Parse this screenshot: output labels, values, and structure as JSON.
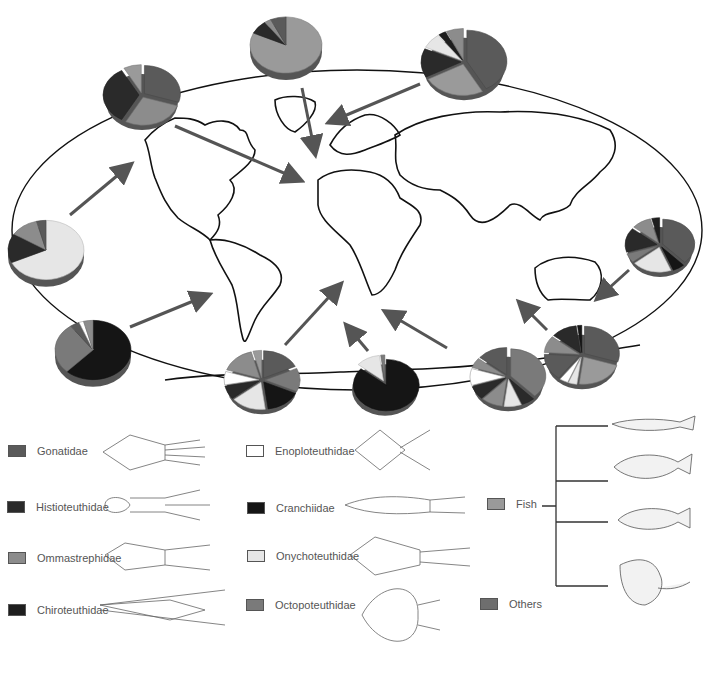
{
  "figure": {
    "type": "world map diagram of cephalopod diet composition (pie charts) with flow arrows",
    "colors": {
      "Gonatidae": "#5a5a5a",
      "Histioteuthidae": "#2a2a2a",
      "Ommastrephidae": "#8c8c8c",
      "Chiroteuthidae": "#1e1e1e",
      "Enoploteuthidae": "#ffffff",
      "Cranchiidae": "#151515",
      "Onychoteuthidae": "#e6e6e6",
      "Octopoteuthidae": "#7a7a7a",
      "Fish": "#9a9a9a",
      "Others": "#6e6e6e"
    }
  },
  "legend": {
    "squid_families": [
      {
        "label": "Gonatidae",
        "key": "Gonatidae"
      },
      {
        "label": "Histioteuthidae",
        "key": "Histioteuthidae"
      },
      {
        "label": "Ommastrephidae",
        "key": "Ommastrephidae"
      },
      {
        "label": "Chiroteuthidae",
        "key": "Chiroteuthidae"
      },
      {
        "label": "Enoploteuthidae",
        "key": "Enoploteuthidae"
      },
      {
        "label": "Cranchiidae",
        "key": "Cranchiidae"
      },
      {
        "label": "Onychoteuthidae",
        "key": "Onychoteuthidae"
      },
      {
        "label": "Octopoteuthidae",
        "key": "Octopoteuthidae"
      }
    ],
    "other": [
      {
        "label": "Fish",
        "key": "Fish"
      },
      {
        "label": "Others",
        "key": "Others"
      }
    ]
  },
  "pies": [
    {
      "id": "north-pacific-east",
      "cx": 142,
      "cy": 95,
      "r": 36,
      "slices": [
        [
          "Gonatidae",
          0.3
        ],
        [
          "Ommastrephidae",
          0.28
        ],
        [
          "Histioteuthidae",
          0.34
        ],
        [
          "Fish",
          0.08
        ]
      ],
      "explode": true
    },
    {
      "id": "greenland",
      "cx": 286,
      "cy": 45,
      "r": 36,
      "slices": [
        [
          "Fish",
          0.82
        ],
        [
          "Histioteuthidae",
          0.08
        ],
        [
          "Ommastrephidae",
          0.03
        ],
        [
          "Gonatidae",
          0.07
        ]
      ],
      "explode": false
    },
    {
      "id": "north-pacific-west",
      "cx": 464,
      "cy": 62,
      "r": 40,
      "slices": [
        [
          "Gonatidae",
          0.42
        ],
        [
          "Fish",
          0.25
        ],
        [
          "Histioteuthidae",
          0.15
        ],
        [
          "Onychoteuthidae",
          0.08
        ],
        [
          "Chiroteuthidae",
          0.03
        ],
        [
          "Ommastrephidae",
          0.07
        ]
      ],
      "explode": true
    },
    {
      "id": "east-pacific",
      "cx": 46,
      "cy": 250,
      "r": 38,
      "slices": [
        [
          "Onychoteuthidae",
          0.68
        ],
        [
          "Histioteuthidae",
          0.16
        ],
        [
          "Ommastrephidae",
          0.12
        ],
        [
          "Gonatidae",
          0.04
        ]
      ],
      "explode": false
    },
    {
      "id": "south-east-pacific",
      "cx": 93,
      "cy": 350,
      "r": 38,
      "slices": [
        [
          "Cranchiidae",
          0.62
        ],
        [
          "Octopoteuthidae",
          0.28
        ],
        [
          "Gonatidae",
          0.04
        ],
        [
          "Enoploteuthidae",
          0.02
        ],
        [
          "Ommastrephidae",
          0.04
        ]
      ],
      "explode": false
    },
    {
      "id": "south-atlantic-west",
      "cx": 262,
      "cy": 380,
      "r": 35,
      "slices": [
        [
          "Gonatidae",
          0.18
        ],
        [
          "Octopoteuthidae",
          0.14
        ],
        [
          "Cranchiidae",
          0.16
        ],
        [
          "Onychoteuthidae",
          0.16
        ],
        [
          "Histioteuthidae",
          0.08
        ],
        [
          "Enoploteuthidae",
          0.08
        ],
        [
          "Ommastrephidae",
          0.16
        ],
        [
          "Fish",
          0.04
        ]
      ],
      "explode": true
    },
    {
      "id": "south-atlantic-east",
      "cx": 385,
      "cy": 383,
      "r": 33,
      "slices": [
        [
          "Cranchiidae",
          0.86
        ],
        [
          "Onychoteuthidae",
          0.12
        ],
        [
          "Octopoteuthidae",
          0.02
        ]
      ],
      "explode": true
    },
    {
      "id": "south-indian-west",
      "cx": 508,
      "cy": 377,
      "r": 35,
      "slices": [
        [
          "Octopoteuthidae",
          0.38
        ],
        [
          "Histioteuthidae",
          0.06
        ],
        [
          "Onychoteuthidae",
          0.08
        ],
        [
          "Ommastrephidae",
          0.1
        ],
        [
          "Histioteuthidae",
          0.08
        ],
        [
          "Enoploteuthidae",
          0.1
        ],
        [
          "Ommastrephidae",
          0.06
        ],
        [
          "Gonatidae",
          0.14
        ]
      ],
      "explode": true
    },
    {
      "id": "south-indian-east",
      "cx": 582,
      "cy": 355,
      "r": 35,
      "slices": [
        [
          "Gonatidae",
          0.3
        ],
        [
          "Fish",
          0.22
        ],
        [
          "Onychoteuthidae",
          0.04
        ],
        [
          "Enoploteuthidae",
          0.04
        ],
        [
          "Gonatidae",
          0.16
        ],
        [
          "Ommastrephidae",
          0.1
        ],
        [
          "Histioteuthidae",
          0.12
        ],
        [
          "Cranchiidae",
          0.02
        ]
      ],
      "explode": true
    },
    {
      "id": "tasman",
      "cx": 660,
      "cy": 245,
      "r": 32,
      "slices": [
        [
          "Gonatidae",
          0.38
        ],
        [
          "Cranchiidae",
          0.06
        ],
        [
          "Onychoteuthidae",
          0.2
        ],
        [
          "Octopoteuthidae",
          0.06
        ],
        [
          "Histioteuthidae",
          0.16
        ],
        [
          "Ommastrephidae",
          0.1
        ],
        [
          "Chiroteuthidae",
          0.04
        ]
      ],
      "explode": true
    }
  ],
  "arrows": [
    {
      "from": [
        175,
        126
      ],
      "to": [
        300,
        180
      ]
    },
    {
      "from": [
        302,
        88
      ],
      "to": [
        315,
        153
      ]
    },
    {
      "from": [
        420,
        84
      ],
      "to": [
        330,
        122
      ]
    },
    {
      "from": [
        70,
        215
      ],
      "to": [
        130,
        165
      ]
    },
    {
      "from": [
        130,
        327
      ],
      "to": [
        208,
        295
      ]
    },
    {
      "from": [
        285,
        345
      ],
      "to": [
        340,
        285
      ]
    },
    {
      "from": [
        368,
        351
      ],
      "to": [
        347,
        326
      ]
    },
    {
      "from": [
        447,
        348
      ],
      "to": [
        386,
        312
      ]
    },
    {
      "from": [
        547,
        330
      ],
      "to": [
        520,
        303
      ]
    },
    {
      "from": [
        629,
        270
      ],
      "to": [
        598,
        298
      ]
    }
  ]
}
